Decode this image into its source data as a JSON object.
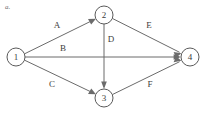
{
  "figure": {
    "part_label": "a.",
    "background_color": "#ffffff",
    "stroke_color": "#6b6b6b",
    "text_color": "#3d3d3d"
  },
  "graph": {
    "type": "directed-graph",
    "nodes": [
      {
        "id": "1",
        "label": "1",
        "cx": 16,
        "cy": 57,
        "r": 9
      },
      {
        "id": "2",
        "label": "2",
        "cx": 104,
        "cy": 15,
        "r": 9
      },
      {
        "id": "3",
        "label": "3",
        "cx": 104,
        "cy": 98,
        "r": 9
      },
      {
        "id": "4",
        "label": "4",
        "cx": 190,
        "cy": 57,
        "r": 9
      }
    ],
    "edges": [
      {
        "id": "A",
        "label": "A",
        "from": "1",
        "to": "2",
        "label_x": 57,
        "label_y": 26
      },
      {
        "id": "B",
        "label": "B",
        "from": "1",
        "to": "4",
        "label_x": 63,
        "label_y": 49
      },
      {
        "id": "C",
        "label": "C",
        "from": "1",
        "to": "3",
        "label_x": 52,
        "label_y": 85
      },
      {
        "id": "D",
        "label": "D",
        "from": "2",
        "to": "3",
        "label_x": 111,
        "label_y": 40
      },
      {
        "id": "E",
        "label": "E",
        "from": "2",
        "to": "4",
        "label_x": 149,
        "label_y": 26
      },
      {
        "id": "F",
        "label": "F",
        "from": "3",
        "to": "4",
        "label_x": 150,
        "label_y": 85
      }
    ]
  }
}
